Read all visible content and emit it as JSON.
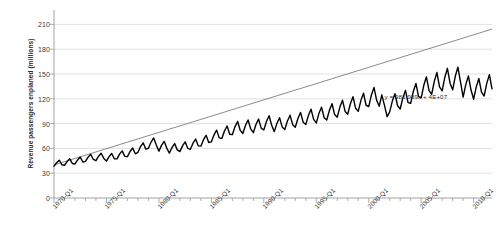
{
  "chart_data": {
    "type": "line",
    "title": "",
    "subtitle": "",
    "xlabel": "",
    "ylabel": "Revenue passengers enplaned (millions)",
    "ylim": [
      0,
      225
    ],
    "yticks": [
      0,
      30,
      60,
      90,
      120,
      150,
      180,
      210
    ],
    "ytick_labels": [
      "0",
      "30",
      "60",
      "90",
      "120",
      "150",
      "180",
      "210"
    ],
    "grid": true,
    "legend": "none",
    "xtick_labels": [
      "1970-Q1",
      "1975-Q1",
      "1980-Q1",
      "1985-Q1",
      "1990-Q1",
      "1995-Q1",
      "2000-Q1",
      "2005-Q1",
      "2010-Q1"
    ],
    "xtick_index": [
      0,
      20,
      40,
      60,
      80,
      100,
      120,
      140,
      160
    ],
    "x_minor_step_quarters": 4,
    "x_start": "1970-Q1",
    "x_end": "2011-Q4",
    "n_points": 168,
    "annotations": [
      {
        "name": "trendline-equation",
        "text": "y = 983,939x + 4E+07",
        "x_index": 126,
        "y_value": 122
      }
    ],
    "series": [
      {
        "name": "Revenue passengers enplaned",
        "color": "#000000",
        "width": 1.4,
        "values": [
          38.5,
          42.6,
          45.8,
          40.2,
          39.6,
          44.1,
          47.4,
          41.8,
          41.2,
          46.0,
          49.5,
          43.6,
          44.3,
          49.4,
          52.9,
          46.6,
          45.1,
          50.6,
          54.2,
          47.9,
          44.6,
          50.0,
          53.8,
          47.5,
          47.3,
          53.0,
          57.0,
          50.4,
          50.1,
          56.2,
          60.5,
          53.5,
          55.3,
          62.1,
          66.8,
          59.1,
          60.2,
          67.7,
          72.6,
          64.0,
          56.7,
          63.7,
          68.5,
          60.4,
          54.3,
          61.1,
          65.8,
          58.2,
          56.1,
          63.1,
          67.9,
          60.1,
          58.9,
          66.3,
          71.3,
          63.1,
          62.7,
          70.5,
          75.8,
          67.1,
          67.9,
          76.3,
          82.1,
          72.7,
          72.0,
          81.0,
          87.1,
          77.1,
          76.6,
          86.1,
          92.6,
          82.0,
          78.1,
          87.8,
          94.4,
          83.6,
          79.0,
          88.8,
          95.5,
          84.5,
          82.3,
          92.5,
          99.5,
          88.1,
          80.3,
          90.3,
          97.1,
          86.0,
          82.9,
          93.2,
          100.2,
          88.7,
          85.6,
          96.2,
          103.5,
          91.6,
          88.9,
          99.9,
          107.4,
          95.1,
          90.8,
          102.1,
          109.8,
          97.2,
          94.3,
          106.0,
          114.0,
          100.9,
          97.8,
          110.0,
          118.3,
          104.7,
          101.4,
          114.0,
          122.6,
          108.5,
          104.8,
          117.8,
          126.7,
          112.2,
          110.6,
          124.3,
          133.7,
          118.4,
          111.0,
          124.8,
          112.0,
          98.5,
          104.2,
          117.2,
          126.1,
          111.6,
          107.7,
          121.1,
          130.2,
          115.3,
          114.6,
          128.9,
          138.6,
          122.7,
          121.2,
          136.3,
          146.6,
          129.8,
          125.5,
          141.1,
          151.8,
          134.4,
          129.7,
          145.8,
          156.9,
          138.9,
          130.9,
          147.2,
          158.3,
          140.1,
          122.0,
          137.2,
          147.6,
          130.6,
          119.5,
          134.4,
          144.5,
          128.0,
          123.4,
          138.7,
          149.2,
          132.1
        ]
      }
    ],
    "trendline": {
      "name": "Linear trendline",
      "type": "linear",
      "equation": "y = 983,939x + 4E+07",
      "slope_millions_per_quarter": 0.983939,
      "intercept_millions": 40,
      "color": "#595959",
      "width": 0.7,
      "y_at_start": 40.0,
      "y_at_end": 204.3
    }
  }
}
